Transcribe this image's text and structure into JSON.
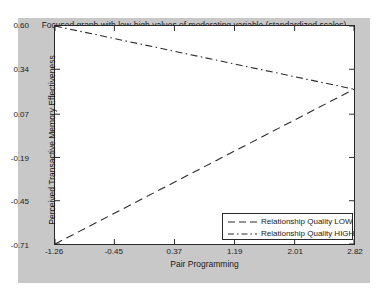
{
  "chart_data": {
    "type": "line",
    "title": "Focused graph with low-high values of moderating variable (standardized scales)",
    "xlabel": "Pair Programming",
    "ylabel": "Perceived Transactive Memory Effectiveness",
    "xlim": [
      -1.26,
      2.82
    ],
    "ylim": [
      -0.71,
      0.6
    ],
    "xticks": [
      "-1.26",
      "-0.45",
      "0.37",
      "1.19",
      "2.01",
      "2.82"
    ],
    "xtick_values": [
      -1.26,
      -0.45,
      0.37,
      1.19,
      2.01,
      2.82
    ],
    "yticks": [
      "0.60",
      "0.34",
      "0.07",
      "-0.19",
      "-0.45",
      "-0.71"
    ],
    "ytick_values": [
      0.6,
      0.34,
      0.07,
      -0.19,
      -0.45,
      -0.71
    ],
    "grid": false,
    "legend_position": "lower right",
    "line_color": "#2a2a2a",
    "plot_background": "#ffffff",
    "figure_background": "#c8c8c8",
    "series": [
      {
        "name": "Relationship Quality LOW",
        "style": "dashed",
        "x": [
          -1.26,
          2.82
        ],
        "values": [
          -0.71,
          0.22
        ]
      },
      {
        "name": "Relationship Quality HIGH",
        "style": "dash-dot",
        "x": [
          -1.26,
          2.82
        ],
        "values": [
          0.6,
          0.22
        ]
      }
    ]
  },
  "legend": {
    "items": [
      {
        "label": "Relationship Quality LOW"
      },
      {
        "label": "Relationship Quality HIGH"
      }
    ]
  }
}
